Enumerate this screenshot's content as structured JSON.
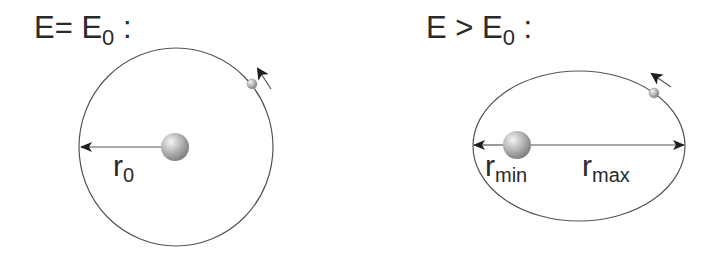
{
  "panels": [
    {
      "id": "circular",
      "title": {
        "main": "E= E",
        "sub": "0",
        "suffix": " :"
      },
      "orbit": {
        "shape": "circle",
        "cx": 176,
        "cy": 147,
        "rx": 97,
        "ry": 99
      },
      "central_body": {
        "cx": 175,
        "cy": 147,
        "r": 14
      },
      "orbiting_body": {
        "cx": 252,
        "cy": 84,
        "r": 5
      },
      "motion_arrow": {
        "x1": 271,
        "y1": 88,
        "x2": 258,
        "y2": 69
      },
      "radius_arrows": [
        {
          "label_main": "r",
          "label_sub": "0",
          "from_x": 161,
          "to_x": 80,
          "y": 147
        }
      ]
    },
    {
      "id": "elliptical",
      "title": {
        "main": "E > E",
        "sub": "0",
        "suffix": " :"
      },
      "orbit": {
        "shape": "ellipse",
        "cx": 579,
        "cy": 146,
        "rx": 106,
        "ry": 75
      },
      "central_body": {
        "cx": 517,
        "cy": 145,
        "r": 14
      },
      "orbiting_body": {
        "cx": 654,
        "cy": 93,
        "r": 5
      },
      "motion_arrow": {
        "x1": 671,
        "y1": 87,
        "x2": 652,
        "y2": 74
      },
      "radius_arrows": [
        {
          "label_main": "r",
          "label_sub": "min",
          "from_x": 503,
          "to_x": 473,
          "y": 145
        },
        {
          "label_main": "r",
          "label_sub": "max",
          "from_x": 531,
          "to_x": 685,
          "y": 145
        }
      ]
    }
  ],
  "colors": {
    "line": "#555555",
    "text": "#2a2a2a",
    "ball_light": "#f2f2f2",
    "ball_dark": "#8a8a8a",
    "arrowhead": "#1e1e1e"
  }
}
